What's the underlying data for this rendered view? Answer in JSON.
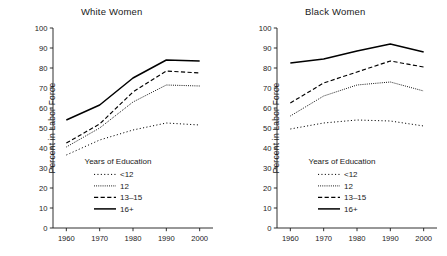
{
  "figure": {
    "ylabel": "Percent in Labor Force",
    "legend_title": "Years of Education"
  },
  "chart_data": {
    "type": "line",
    "title": "",
    "panels": [
      {
        "title": "White Women",
        "xlabel": "",
        "ylabel": "Percent in Labor Force",
        "x": [
          1960,
          1970,
          1980,
          1990,
          2000
        ],
        "xlim": [
          1956,
          2004
        ],
        "ylim": [
          0,
          100
        ],
        "xticks": [
          1960,
          1970,
          1980,
          1990,
          2000
        ],
        "yticks": [
          0,
          10,
          20,
          30,
          40,
          50,
          60,
          70,
          80,
          90,
          100
        ],
        "grid": false,
        "legend_title": "Years of Education",
        "legend_position": "lower-center-right",
        "series": [
          {
            "name": "<12",
            "style": "dotted",
            "values": [
              36.5,
              44.0,
              49.0,
              52.5,
              51.5
            ]
          },
          {
            "name": "12",
            "style": "fine-dotted",
            "values": [
              40.5,
              50.0,
              63.0,
              71.5,
              71.0
            ]
          },
          {
            "name": "13-15",
            "style": "dashed",
            "values": [
              42.5,
              52.0,
              68.0,
              78.5,
              77.5
            ]
          },
          {
            "name": "16+",
            "style": "solid",
            "values": [
              54.0,
              61.5,
              75.0,
              84.0,
              83.5
            ]
          }
        ]
      },
      {
        "title": "Black Women",
        "xlabel": "",
        "ylabel": "Percent in Labor Force",
        "x": [
          1960,
          1970,
          1980,
          1990,
          2000
        ],
        "xlim": [
          1956,
          2004
        ],
        "ylim": [
          0,
          100
        ],
        "xticks": [
          1960,
          1970,
          1980,
          1990,
          2000
        ],
        "yticks": [
          0,
          10,
          20,
          30,
          40,
          50,
          60,
          70,
          80,
          90,
          100
        ],
        "grid": false,
        "legend_title": "Years of Education",
        "legend_position": "lower-center-right",
        "series": [
          {
            "name": "<12",
            "style": "dotted",
            "values": [
              49.5,
              52.5,
              54.0,
              53.5,
              51.0
            ]
          },
          {
            "name": "12",
            "style": "fine-dotted",
            "values": [
              56.0,
              66.0,
              71.5,
              73.0,
              68.5
            ]
          },
          {
            "name": "13-15",
            "style": "dashed",
            "values": [
              62.5,
              72.5,
              78.0,
              83.5,
              80.5
            ]
          },
          {
            "name": "16+",
            "style": "solid",
            "values": [
              82.5,
              84.5,
              88.5,
              92.0,
              88.0
            ]
          }
        ]
      }
    ],
    "legend": [
      {
        "label": "<12",
        "style": "dotted"
      },
      {
        "label": "12",
        "style": "fine-dotted"
      },
      {
        "label": "13–15",
        "style": "dashed"
      },
      {
        "label": "16+",
        "style": "solid"
      }
    ]
  }
}
